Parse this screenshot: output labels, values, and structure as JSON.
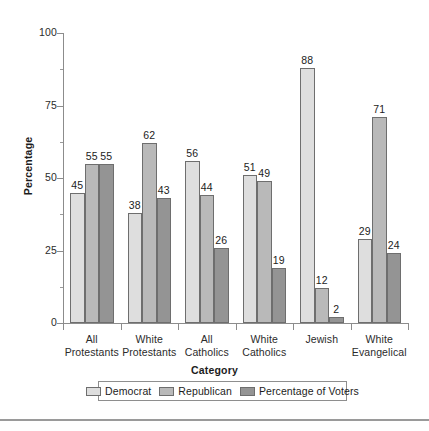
{
  "chart_data": {
    "type": "bar",
    "title": "",
    "xlabel": "Category",
    "ylabel": "Percentage",
    "ylim": [
      0,
      100
    ],
    "yticks": [
      0,
      25,
      50,
      75,
      100
    ],
    "ytick_labels": [
      "0",
      "25",
      "50",
      "75",
      "100"
    ],
    "yminor_ticks": [
      12.5,
      37.5,
      62.5,
      87.5
    ],
    "grid": false,
    "legend_position": "bottom",
    "categories": [
      "All\nProtestants",
      "White\nProtestants",
      "All\nCatholics",
      "White\nCatholics",
      "Jewish",
      "White\nEvangelical"
    ],
    "category_lines": [
      [
        "All",
        "Protestants"
      ],
      [
        "White",
        "Protestants"
      ],
      [
        "All",
        "Catholics"
      ],
      [
        "White",
        "Catholics"
      ],
      [
        "Jewish",
        ""
      ],
      [
        "White",
        "Evangelical"
      ]
    ],
    "series": [
      {
        "name": "Democrat",
        "color": "#dedede",
        "values": [
          45,
          38,
          56,
          51,
          88,
          29
        ]
      },
      {
        "name": "Republican",
        "color": "#b9b9b9",
        "values": [
          55,
          62,
          44,
          49,
          12,
          71
        ]
      },
      {
        "name": "Percentage of Voters",
        "color": "#949494",
        "values": [
          55,
          43,
          26,
          19,
          2,
          24
        ]
      }
    ]
  },
  "legend": {
    "items": [
      {
        "label": "Democrat",
        "color": "#dedede"
      },
      {
        "label": "Republican",
        "color": "#b9b9b9"
      },
      {
        "label": "Percentage of Voters",
        "color": "#949494"
      }
    ]
  },
  "axes": {
    "y_title": "Percentage",
    "x_title": "Category"
  }
}
